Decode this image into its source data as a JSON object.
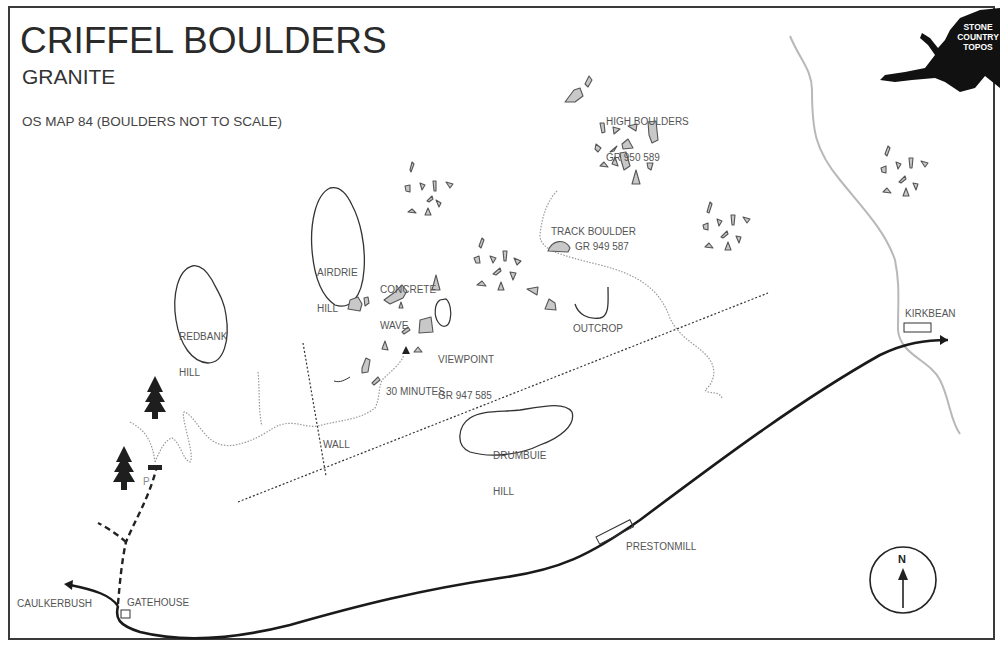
{
  "header": {
    "title": "CRIFFEL BOULDERS",
    "subtitle": "GRANITE",
    "note": "OS MAP 84 (BOULDERS NOT TO SCALE)"
  },
  "logo": {
    "line1": "STONE",
    "line2": "COUNTRY",
    "line3": "TOPOS"
  },
  "places": {
    "high_boulders": {
      "name": "HIGH BOULDERS",
      "grid_ref": "GR 950 589"
    },
    "track_boulder": {
      "name": "TRACK BOULDER",
      "grid_ref": "GR 949 587"
    },
    "viewpoint": {
      "name": "VIEWPOINT",
      "grid_ref": "GR 947 585"
    },
    "concrete_wave": {
      "line1": "CONCRETE",
      "line2": "WAVE"
    },
    "outcrop": "OUTCROP",
    "airdrie_hill": {
      "line1": "AIRDRIE",
      "line2": "HILL"
    },
    "redbank_hill": {
      "line1": "REDBANK",
      "line2": "HILL"
    },
    "drumbuie_hill": {
      "line1": "DRUMBUIE",
      "line2": "HILL"
    },
    "wall": "WALL",
    "walk_time": "30 MINUTES",
    "parking": "P",
    "kirkbean": "KIRKBEAN",
    "prestonmill": "PRESTONMILL",
    "caulkerbush": "CAULKERBUSH",
    "gatehouse": "GATEHOUSE"
  },
  "compass": {
    "label": "N"
  },
  "colors": {
    "boulder_fill": "#c8c8c8",
    "boulder_stroke": "#555555",
    "road": "#1a1a1a",
    "stream": "#b5b5b5",
    "path": "#888888"
  }
}
